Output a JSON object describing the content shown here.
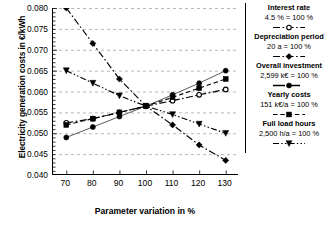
{
  "chart_data": {
    "type": "line",
    "title": "",
    "xlabel": "Parameter variation in %",
    "ylabel": "Electricity generation costs in €/kWh",
    "xlim": [
      65,
      135
    ],
    "ylim": [
      0.04,
      0.08
    ],
    "xticks": [
      70,
      80,
      90,
      100,
      110,
      120,
      130
    ],
    "yticks": [
      0.04,
      0.045,
      0.05,
      0.055,
      0.06,
      0.065,
      0.07,
      0.075,
      0.08
    ],
    "ytick_labels": [
      "0.040",
      "0.045",
      "0.050",
      "0.055",
      "0.060",
      "0.065",
      "0.070",
      "0.075",
      "0.080"
    ],
    "xtick_labels": [
      "70",
      "80",
      "90",
      "100",
      "110",
      "120",
      "130"
    ],
    "grid": "horizontal-dashed",
    "legend_position": "right",
    "x": [
      70,
      80,
      90,
      100,
      110,
      120,
      130
    ],
    "series": [
      {
        "name": "Interest rate",
        "reference": "4.5 % = 100 %",
        "marker": "open-circle",
        "linestyle": "dash-dot",
        "color": "#000000",
        "values": [
          0.0525,
          0.0535,
          0.055,
          0.0565,
          0.0578,
          0.0592,
          0.0605
        ]
      },
      {
        "name": "Depreciation period",
        "reference": "20 a = 100 %",
        "marker": "filled-diamond",
        "linestyle": "dash-dot",
        "color": "#000000",
        "values": [
          0.08,
          0.0715,
          0.063,
          0.0565,
          0.052,
          0.0472,
          0.0435
        ]
      },
      {
        "name": "Overall investment",
        "reference": "2,599 k€ = 100 %",
        "marker": "filled-circle",
        "linestyle": "solid-dot",
        "color": "#000000",
        "values": [
          0.049,
          0.0515,
          0.054,
          0.0565,
          0.0592,
          0.062,
          0.065
        ]
      },
      {
        "name": "Yearly costs",
        "reference": "151 k€/a = 100 %",
        "marker": "filled-square",
        "linestyle": "dashed",
        "color": "#000000",
        "values": [
          0.052,
          0.0535,
          0.055,
          0.0565,
          0.0586,
          0.0608,
          0.063
        ]
      },
      {
        "name": "Full load hours",
        "reference": "2,500 h/a = 100 %",
        "marker": "filled-triangle",
        "linestyle": "dash-dot-dot",
        "color": "#000000",
        "values": [
          0.065,
          0.062,
          0.059,
          0.0565,
          0.0545,
          0.0522,
          0.05
        ]
      }
    ]
  },
  "legend": {
    "entries": [
      {
        "title": "Interest rate",
        "value": "4.5 % = 100 %"
      },
      {
        "title": "Depreciation period",
        "value": "20 a = 100 %"
      },
      {
        "title": "Overall investment",
        "value": "2,599 k€ = 100 %"
      },
      {
        "title": "Yearly costs",
        "value": "151 k€/a = 100 %"
      },
      {
        "title": "Full load hours",
        "value": "2,500 h/a = 100 %"
      }
    ]
  }
}
